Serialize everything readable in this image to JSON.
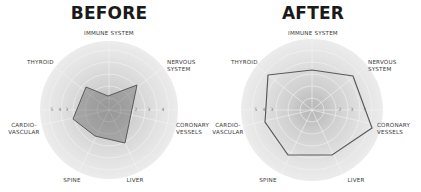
{
  "chart_data": [
    {
      "type": "radar",
      "title": "BEFORE",
      "axes": [
        "IMMUNE SYSTEM",
        "NERVOUS SYSTEM",
        "CORONARY VESSELS",
        "LIVER",
        "SPINE",
        "CARDIO-VASCULAR",
        "THYROID"
      ],
      "tick_labels_left": [
        "5",
        "4",
        "3"
      ],
      "tick_labels_right": [
        "2",
        "3",
        "4"
      ],
      "series": [
        {
          "name": "Before",
          "values": [
            1.3,
            4.0,
            1.8,
            4.0,
            2.5,
            3.2,
            3.5
          ]
        }
      ],
      "range": [
        0,
        6
      ],
      "grid": true,
      "legend": "none"
    },
    {
      "type": "radar",
      "title": "AFTER",
      "axes": [
        "IMMUNE SYSTEM",
        "NERVOUS SYSTEM",
        "CORONARY VESSELS",
        "LIVER",
        "SPINE",
        "CARDIO-VASCULAR",
        "THYROID"
      ],
      "tick_labels_left": [
        "5",
        "4",
        "3"
      ],
      "tick_labels_right": [
        "2",
        "3",
        "4"
      ],
      "series": [
        {
          "name": "After",
          "values": [
            4.0,
            5.0,
            5.2,
            4.8,
            4.8,
            4.4,
            5.0
          ]
        }
      ],
      "range": [
        0,
        6
      ],
      "grid": true,
      "legend": "none"
    }
  ],
  "before": {
    "title": "BEFORE",
    "labels": {
      "immune": "IMMUNE SYSTEM",
      "thyroid": "THYROID",
      "nervous_1": "NERVOUS",
      "nervous_2": "SYSTEM",
      "cardio_1": "CARDIO-",
      "cardio_2": "VASCULAR",
      "coronary_1": "CORONARY",
      "coronary_2": "VESSELS",
      "spine": "SPINE",
      "liver": "LIVER"
    },
    "ticks": {
      "l1": "5",
      "l2": "4",
      "l3": "3",
      "r1": "2",
      "r2": "3",
      "r3": "4"
    },
    "polygon_points": "86,87 108,96 137,85 125,143 95,136 73,119"
  },
  "after": {
    "title": "AFTER",
    "labels": {
      "immune": "IMMUNE SYSTEM",
      "thyroid": "THYROID",
      "nervous_1": "NERVOUS",
      "nervous_2": "SYSTEM",
      "cardio_1": "CARDIO-",
      "cardio_2": "VASCULAR",
      "coronary_1": "CORONARY",
      "coronary_2": "VESSELS",
      "spine": "SPINE",
      "liver": "LIVER"
    },
    "ticks": {
      "l1": "5",
      "l2": "4",
      "l3": "3",
      "r1": "2",
      "r2": "3",
      "r3": "4"
    },
    "polygon_points": "268,75 312,70 353,76 372,128 332,155 288,155 265,122"
  },
  "colors": {
    "polygon_stroke": "#5a5a5a",
    "before_fill": "#8a8a8a",
    "circle_edge": "#e6e6e6",
    "circle_center": "#b8b8b8"
  }
}
